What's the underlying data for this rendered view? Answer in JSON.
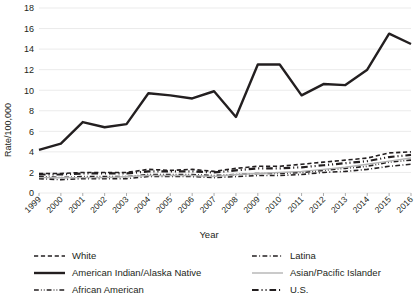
{
  "chart_data": {
    "type": "line",
    "title": "",
    "xlabel": "Year",
    "ylabel": "Rate/100,000",
    "x": [
      1999,
      2000,
      2001,
      2002,
      2003,
      2004,
      2005,
      2006,
      2007,
      2008,
      2009,
      2010,
      2011,
      2012,
      2013,
      2014,
      2015,
      2016
    ],
    "xlim": [
      1999,
      2016
    ],
    "ylim": [
      0,
      18
    ],
    "yticks": [
      0,
      2,
      4,
      6,
      8,
      10,
      12,
      14,
      16,
      18
    ],
    "grid": "horizontal",
    "legend_position": "bottom",
    "legend_columns": 2,
    "series": [
      {
        "name": "White",
        "style": "dashed",
        "color": "#231f20",
        "width": 1.6,
        "values": [
          1.9,
          1.9,
          2.0,
          2.0,
          2.0,
          2.3,
          2.2,
          2.3,
          2.1,
          2.4,
          2.6,
          2.6,
          2.8,
          3.0,
          3.2,
          3.4,
          3.9,
          4.0
        ]
      },
      {
        "name": "American Indian/Alaska Native",
        "style": "solid",
        "color": "#231f20",
        "width": 2.4,
        "values": [
          4.2,
          4.8,
          6.9,
          6.4,
          6.7,
          9.7,
          9.5,
          9.2,
          9.9,
          7.4,
          12.5,
          12.5,
          9.5,
          10.6,
          10.5,
          12.0,
          15.5,
          14.5
        ]
      },
      {
        "name": "African American",
        "style": "dash-dot-dot",
        "color": "#231f20",
        "width": 1.6,
        "values": [
          1.6,
          1.5,
          1.6,
          1.6,
          1.6,
          1.8,
          1.8,
          1.8,
          1.7,
          1.8,
          1.9,
          1.9,
          2.0,
          2.2,
          2.4,
          2.6,
          3.0,
          3.2
        ]
      },
      {
        "name": "Latina",
        "style": "dash-dot",
        "color": "#231f20",
        "width": 1.6,
        "values": [
          1.4,
          1.3,
          1.4,
          1.4,
          1.4,
          1.6,
          1.6,
          1.6,
          1.5,
          1.6,
          1.7,
          1.7,
          1.8,
          2.0,
          2.1,
          2.3,
          2.6,
          2.8
        ]
      },
      {
        "name": "Asian/Pacific Islander",
        "style": "solid",
        "color": "#b3b3b3",
        "width": 1.4,
        "values": [
          1.5,
          1.5,
          1.5,
          1.5,
          1.6,
          1.7,
          1.7,
          1.7,
          1.6,
          1.8,
          1.9,
          2.0,
          2.1,
          2.3,
          2.5,
          2.8,
          3.1,
          3.4
        ]
      },
      {
        "name": "U.S.",
        "style": "dash-dot-dot",
        "color": "#231f20",
        "width": 2.2,
        "values": [
          1.8,
          1.8,
          1.9,
          1.9,
          1.9,
          2.1,
          2.1,
          2.1,
          2.0,
          2.2,
          2.4,
          2.4,
          2.5,
          2.7,
          2.9,
          3.1,
          3.5,
          3.7
        ]
      }
    ]
  },
  "axes": {
    "y_title": "Rate/100,000",
    "x_title": "Year",
    "y_ticks": [
      "0",
      "2",
      "4",
      "6",
      "8",
      "10",
      "12",
      "14",
      "16",
      "18"
    ],
    "x_ticks": [
      "1999",
      "2000",
      "2001",
      "2002",
      "2003",
      "2004",
      "2005",
      "2006",
      "2007",
      "2008",
      "2009",
      "2010",
      "2011",
      "2012",
      "2013",
      "2014",
      "2015",
      "2016"
    ]
  },
  "legend": {
    "column_left": [
      {
        "label": "White"
      },
      {
        "label": "American Indian/Alaska Native"
      },
      {
        "label": "African American"
      }
    ],
    "column_right": [
      {
        "label": "Latina"
      },
      {
        "label": "Asian/Pacific Islander"
      },
      {
        "label": "U.S."
      }
    ]
  },
  "colors": {
    "ink": "#231f20",
    "grid": "#ebebeb",
    "gray_series": "#b3b3b3",
    "background": "#ffffff"
  }
}
